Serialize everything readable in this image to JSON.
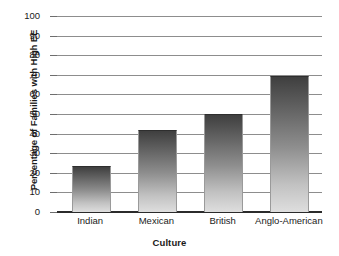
{
  "chart_data": {
    "type": "bar",
    "title": "",
    "xlabel": "Culture",
    "ylabel": "Percentage of Families with High EE",
    "categories": [
      "Indian",
      "Mexican",
      "British",
      "Anglo-American"
    ],
    "values": [
      23,
      41.5,
      49.5,
      69
    ],
    "ylim": [
      0,
      100
    ],
    "yticks": [
      0,
      10,
      20,
      30,
      40,
      50,
      60,
      70,
      80,
      90,
      100
    ],
    "ytick_labels": [
      "0",
      "10",
      "20",
      "30",
      "40",
      "50",
      "60",
      "70",
      "80",
      "90",
      "100"
    ],
    "grid": true,
    "legend": false,
    "bar_color_top": "#3f3f3f",
    "bar_color_bottom": "#dedede",
    "gridline_color": "#8d8d8d",
    "axis_color": "#2b2b2b"
  }
}
